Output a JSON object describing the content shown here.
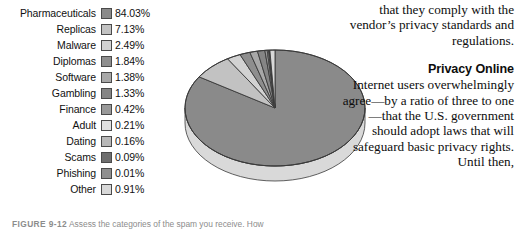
{
  "legend": {
    "rows": [
      {
        "label": "Pharmaceuticals",
        "value": "84.03%",
        "color": "#8a8a8a"
      },
      {
        "label": "Replicas",
        "value": "7.13%",
        "color": "#c2c2c2"
      },
      {
        "label": "Malware",
        "value": "2.49%",
        "color": "#d2d2d2"
      },
      {
        "label": "Diplomas",
        "value": "1.84%",
        "color": "#8e8e8e"
      },
      {
        "label": "Software",
        "value": "1.38%",
        "color": "#a8a8a8"
      },
      {
        "label": "Gambling",
        "value": "1.33%",
        "color": "#858585"
      },
      {
        "label": "Finance",
        "value": "0.42%",
        "color": "#999999"
      },
      {
        "label": "Adult",
        "value": "0.21%",
        "color": "#e0e0e0"
      },
      {
        "label": "Dating",
        "value": "0.16%",
        "color": "#b8b8b8"
      },
      {
        "label": "Scams",
        "value": "0.09%",
        "color": "#6e6e6e"
      },
      {
        "label": "Phishing",
        "value": "0.01%",
        "color": "#8f8f8f"
      },
      {
        "label": "Other",
        "value": "0.91%",
        "color": "#d8d8d8"
      }
    ]
  },
  "chart_data": {
    "type": "pie",
    "title": "",
    "three_d": true,
    "categories": [
      "Pharmaceuticals",
      "Replicas",
      "Malware",
      "Diplomas",
      "Software",
      "Gambling",
      "Finance",
      "Adult",
      "Dating",
      "Scams",
      "Phishing",
      "Other"
    ],
    "values": [
      84.03,
      7.13,
      2.49,
      1.84,
      1.38,
      1.33,
      0.42,
      0.21,
      0.16,
      0.09,
      0.01,
      0.91
    ],
    "unit": "%",
    "colors": [
      "#8a8a8a",
      "#c2c2c2",
      "#d2d2d2",
      "#8e8e8e",
      "#a8a8a8",
      "#858585",
      "#999999",
      "#e0e0e0",
      "#b8b8b8",
      "#6e6e6e",
      "#8f8f8f",
      "#d8d8d8"
    ],
    "legend_position": "left",
    "start_angle_deg": -90,
    "direction": "clockwise",
    "side_wall_color": "#d9d9d9",
    "outline_color": "#3a3a3a"
  },
  "right_text": {
    "paragraph_top": "that they comply with the vendor’s privacy standards and regulations.",
    "heading": "Privacy Online",
    "paragraph_body": "Internet users overwhelmingly agree—by a ratio of three to one—that the U.S. government should adopt laws that will safeguard basic privacy rights. Until then,"
  },
  "caption": {
    "figure_number": "FIGURE 9-12",
    "text": "Assess the categories of the spam you receive. How"
  }
}
